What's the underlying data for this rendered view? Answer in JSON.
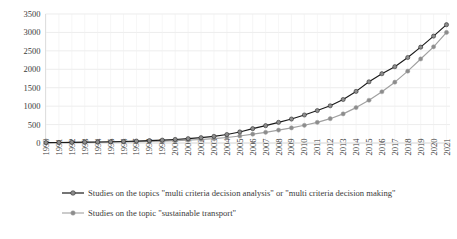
{
  "chart_data": {
    "type": "line",
    "title": "",
    "xlabel": "",
    "ylabel": "",
    "ylim": [
      0,
      3500
    ],
    "ytick_step": 500,
    "yticks": [
      0,
      500,
      1000,
      1500,
      2000,
      2500,
      3000,
      3500
    ],
    "grid": true,
    "legend_position": "bottom-left",
    "categories": [
      "1990",
      "1991",
      "1992",
      "1993",
      "1994",
      "1995",
      "1996",
      "1997",
      "1998",
      "1999",
      "2000",
      "2001",
      "2002",
      "2003",
      "2004",
      "2005",
      "2006",
      "2007",
      "2008",
      "2009",
      "2010",
      "2011",
      "2012",
      "2013",
      "2014",
      "2015",
      "2016",
      "2017",
      "2018",
      "2019",
      "2020",
      "2021"
    ],
    "series": [
      {
        "name": "Studies on the topics \"multi criteria decision analysis\" or \"multi criteria decision making\"",
        "color": "#1a1a1a",
        "marker_color": "#8c8c8c",
        "values": [
          10,
          14,
          18,
          22,
          28,
          34,
          42,
          52,
          64,
          78,
          96,
          118,
          145,
          180,
          230,
          300,
          390,
          470,
          560,
          650,
          760,
          880,
          1010,
          1180,
          1400,
          1660,
          1880,
          2070,
          2320,
          2600,
          2900,
          3210
        ]
      },
      {
        "name": "Studies on the topic \"sustainable transport\"",
        "color": "#a0a0a0",
        "marker_color": "#8c8c8c",
        "values": [
          6,
          8,
          11,
          14,
          18,
          22,
          27,
          34,
          42,
          52,
          64,
          78,
          95,
          118,
          150,
          190,
          240,
          290,
          350,
          410,
          480,
          560,
          660,
          790,
          960,
          1160,
          1390,
          1650,
          1950,
          2280,
          2610,
          3000
        ]
      }
    ]
  },
  "legend": {
    "items": [
      {
        "label": "Studies on the topics \"multi criteria decision analysis\" or \"multi criteria decision making\"",
        "line_color": "#1a1a1a",
        "marker_color": "#8c8c8c"
      },
      {
        "label": "Studies on the topic \"sustainable transport\"",
        "line_color": "#a8a8a8",
        "marker_color": "#8c8c8c"
      }
    ]
  }
}
